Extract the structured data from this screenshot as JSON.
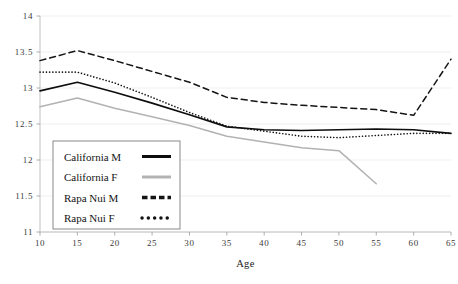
{
  "chart_data": {
    "type": "line",
    "title": "",
    "xlabel": "Age",
    "ylabel": "",
    "x": [
      10,
      15,
      20,
      25,
      30,
      35,
      40,
      45,
      50,
      55,
      60,
      65
    ],
    "xlim": [
      10,
      65
    ],
    "ylim": [
      11,
      14
    ],
    "xticks": [
      10,
      15,
      20,
      25,
      30,
      35,
      40,
      45,
      50,
      55,
      60,
      65
    ],
    "yticks": [
      11,
      11.5,
      12,
      12.5,
      13,
      13.5,
      14
    ],
    "xtick_labels": [
      "10",
      "15",
      "20",
      "25",
      "30",
      "35",
      "40",
      "45",
      "50",
      "55",
      "60",
      "65"
    ],
    "ytick_labels": [
      "11",
      "11.5",
      "12",
      "12.5",
      "13",
      "13.5",
      "14"
    ],
    "grid": true,
    "legend_position": "lower-left-inside",
    "series": [
      {
        "name": "California M",
        "style": "solid",
        "color": "#0d0d0d",
        "width": 1.6,
        "x": [
          10,
          15,
          20,
          25,
          30,
          35,
          40,
          45,
          50,
          55,
          60,
          65
        ],
        "values": [
          12.96,
          13.08,
          12.94,
          12.79,
          12.63,
          12.46,
          12.42,
          12.41,
          12.42,
          12.43,
          12.42,
          12.37
        ]
      },
      {
        "name": "California F",
        "style": "solid",
        "color": "#b2b2b2",
        "width": 1.5,
        "x": [
          10,
          15,
          20,
          25,
          30,
          35,
          40,
          45,
          50,
          55
        ],
        "values": [
          12.74,
          12.86,
          12.72,
          12.6,
          12.48,
          12.33,
          12.25,
          12.17,
          12.13,
          11.67
        ]
      },
      {
        "name": "Rapa Nui M",
        "style": "dashed",
        "color": "#141414",
        "width": 1.5,
        "x": [
          10,
          15,
          20,
          25,
          30,
          35,
          40,
          45,
          50,
          55,
          60,
          65
        ],
        "values": [
          13.38,
          13.52,
          13.38,
          13.23,
          13.08,
          12.87,
          12.8,
          12.76,
          12.73,
          12.7,
          12.62,
          13.4
        ]
      },
      {
        "name": "Rapa Nui F",
        "style": "dotted",
        "color": "#141414",
        "width": 1.6,
        "x": [
          10,
          15,
          20,
          25,
          30,
          35,
          40,
          45,
          50,
          55,
          60,
          65
        ],
        "values": [
          13.22,
          13.22,
          13.07,
          12.87,
          12.66,
          12.47,
          12.4,
          12.33,
          12.31,
          12.34,
          12.37,
          12.37
        ]
      }
    ]
  },
  "legend": {
    "entries": [
      {
        "label": "California M"
      },
      {
        "label": "California F"
      },
      {
        "label": "Rapa Nui M"
      },
      {
        "label": "Rapa Nui F"
      }
    ]
  }
}
